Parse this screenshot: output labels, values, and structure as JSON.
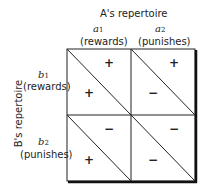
{
  "col_header": {
    "title": "A's repertoire",
    "cols": [
      {
        "var": "a",
        "sub": "1",
        "label": "(rewards)"
      },
      {
        "var": "a",
        "sub": "2",
        "label": "(punishes)"
      }
    ]
  },
  "row_header": {
    "title": "B's repertoire",
    "rows": [
      {
        "var": "b",
        "sub": "1",
        "label": "(rewards)"
      },
      {
        "var": "b",
        "sub": "2",
        "label": "(punishes)"
      }
    ]
  },
  "cells": [
    {
      "upper": "+",
      "lower": "+"
    },
    {
      "upper": "+",
      "lower": "−"
    },
    {
      "upper": "−",
      "lower": "+"
    },
    {
      "upper": "−",
      "lower": "−"
    }
  ]
}
